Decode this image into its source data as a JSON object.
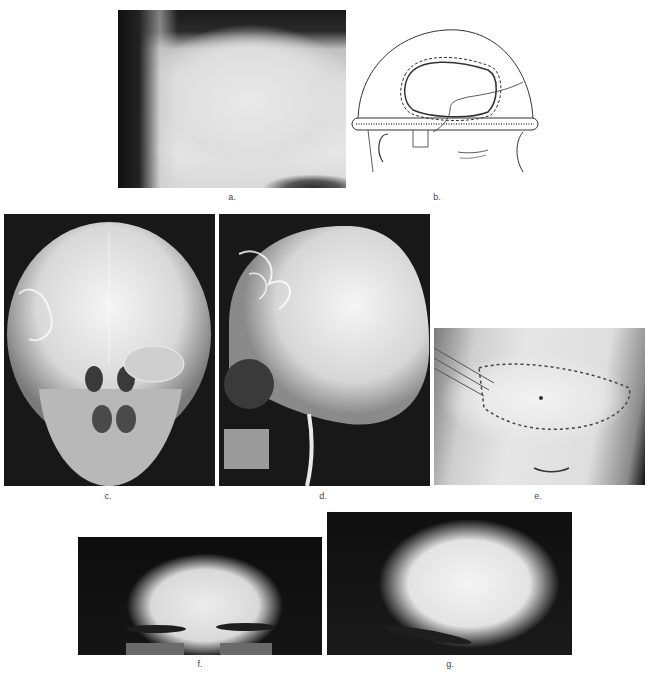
{
  "figure": {
    "panels": [
      {
        "id": "a",
        "label": "a.",
        "description": "Clinical photograph of forehead showing lesion near hairline"
      },
      {
        "id": "b",
        "label": "b.",
        "description": "Schematic drawing of head with outlined bone flap region"
      },
      {
        "id": "c",
        "label": "c.",
        "description": "Frontal skull radiograph (AP view)"
      },
      {
        "id": "d",
        "label": "d.",
        "description": "Lateral skull radiograph"
      },
      {
        "id": "e",
        "label": "e.",
        "description": "Intraoperative photograph with sutured flap"
      },
      {
        "id": "f",
        "label": "f.",
        "description": "Postoperative frontal photograph"
      },
      {
        "id": "g",
        "label": "g.",
        "description": "Postoperative oblique photograph"
      }
    ]
  }
}
